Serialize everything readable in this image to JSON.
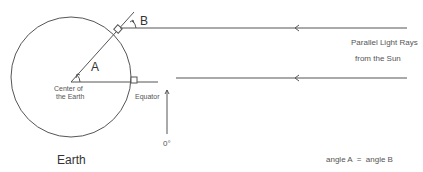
{
  "diagram": {
    "labels": {
      "angle_a": "A",
      "angle_b": "B",
      "center_line1": "Center of",
      "center_line2": "the Earth",
      "equator": "Equator",
      "zero_deg": "0°",
      "earth": "Earth",
      "rays_line1": "Parallel Light Rays",
      "rays_line2": "from the Sun",
      "equation": "angle A  =  angle B"
    },
    "colors": {
      "stroke": "#555555",
      "background": "#ffffff"
    }
  }
}
